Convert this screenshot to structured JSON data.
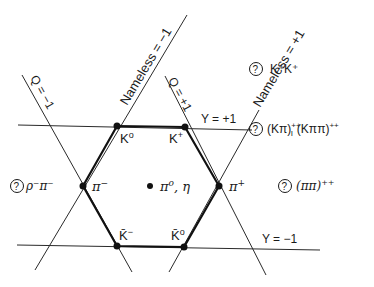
{
  "diagram": {
    "colors": {
      "line": "#2a2a2a",
      "background": "#ffffff"
    },
    "lines": {
      "q_minus": {
        "label": "Q = −1"
      },
      "q_plus": {
        "label": "Q = +1"
      },
      "nameless_minus": {
        "label": "Nameless = −1"
      },
      "nameless_plus": {
        "label": "Nameless = +1"
      },
      "y_plus": {
        "label": "Y = +1"
      },
      "y_minus": {
        "label": "Y = −1"
      }
    },
    "particles": [
      {
        "id": "K0",
        "label": "K",
        "sup": "o"
      },
      {
        "id": "Kplus",
        "label": "K",
        "sup": "+"
      },
      {
        "id": "piminus",
        "label": "π",
        "sup": "−"
      },
      {
        "id": "piplus",
        "label": "π",
        "sup": "+"
      },
      {
        "id": "Kbarminus",
        "label": "K̄",
        "sup": "−"
      },
      {
        "id": "Kbar0",
        "label": "K̄",
        "sup": "o"
      },
      {
        "id": "pi0eta",
        "label": "π",
        "sup": "o",
        "suffix": ", η"
      }
    ],
    "exotics": [
      {
        "id": "KK",
        "mark": "?",
        "text": "K⁺K⁺"
      },
      {
        "id": "Kpi",
        "mark": "?",
        "text": "(Kπ)",
        "sup1": "++",
        "sub1": "I",
        "text2": "(Kππ)",
        "sup2": "++"
      },
      {
        "id": "rhopi",
        "mark": "?",
        "text": "ρ⁻π⁻"
      },
      {
        "id": "pipi",
        "mark": "?",
        "text": "(ππ)",
        "sup": "++"
      }
    ]
  }
}
